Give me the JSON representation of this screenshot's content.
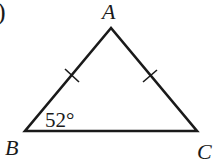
{
  "figure": {
    "type": "isosceles-triangle",
    "prefix_mark": ")",
    "vertices": [
      {
        "label": "A",
        "x": 111,
        "y": 28
      },
      {
        "label": "B",
        "x": 25,
        "y": 131
      },
      {
        "label": "C",
        "x": 197,
        "y": 131
      }
    ],
    "equal_sides": [
      "AB",
      "AC"
    ],
    "angle_marks": [
      {
        "vertex": "B",
        "text": "52°"
      }
    ],
    "stroke_color": "#1a1a1a",
    "background": "#ffffff"
  }
}
